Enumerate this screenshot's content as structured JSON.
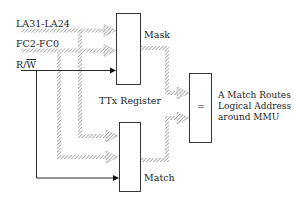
{
  "diagram": {
    "inputs": {
      "la": "LA31-LA24",
      "fc": "FC2-FC0",
      "rw_r": "R/",
      "rw_w": "W"
    },
    "blocks": {
      "mask": "Mask",
      "match": "Match",
      "compare": "=",
      "register": "TTx Register"
    },
    "output_text": [
      "A Match Routes",
      "Logical Address",
      "around  MMU"
    ]
  }
}
